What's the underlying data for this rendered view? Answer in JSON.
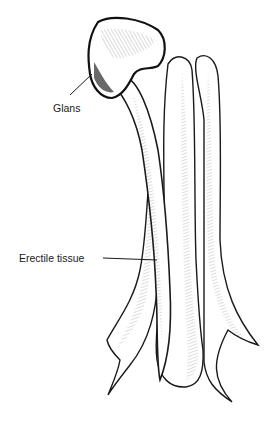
{
  "figure": {
    "type": "anatomical-line-illustration",
    "background": "#ffffff",
    "ink_color": "#1a1a1a",
    "labels": [
      {
        "id": "glans",
        "text": "Glans"
      },
      {
        "id": "erectile",
        "text": "Erectile tissue"
      }
    ]
  }
}
